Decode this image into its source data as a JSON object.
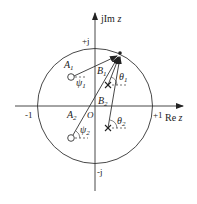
{
  "diagram": {
    "axes": {
      "real_label": "Re z",
      "imag_label": "jIm z",
      "plus_one": "+1",
      "minus_one": "-1",
      "plus_j": "+j",
      "minus_j": "-j",
      "origin": "O"
    },
    "vectors": {
      "A1": "A",
      "A1_sub": "1",
      "A2": "A",
      "A2_sub": "2",
      "B1": "B",
      "B1_sub": "1",
      "B2": "B",
      "B2_sub": "2"
    },
    "angles": {
      "psi1": "ψ",
      "psi1_sub": "1",
      "psi2": "ψ",
      "psi2_sub": "2",
      "theta1": "θ",
      "theta1_sub": "1",
      "theta2": "θ",
      "theta2_sub": "2"
    },
    "markers": {
      "zeros": [
        "zero-1",
        "zero-2"
      ],
      "poles": [
        "pole-1",
        "pole-2"
      ]
    },
    "colors": {
      "stroke": "#222222",
      "background": "#ffffff"
    }
  }
}
